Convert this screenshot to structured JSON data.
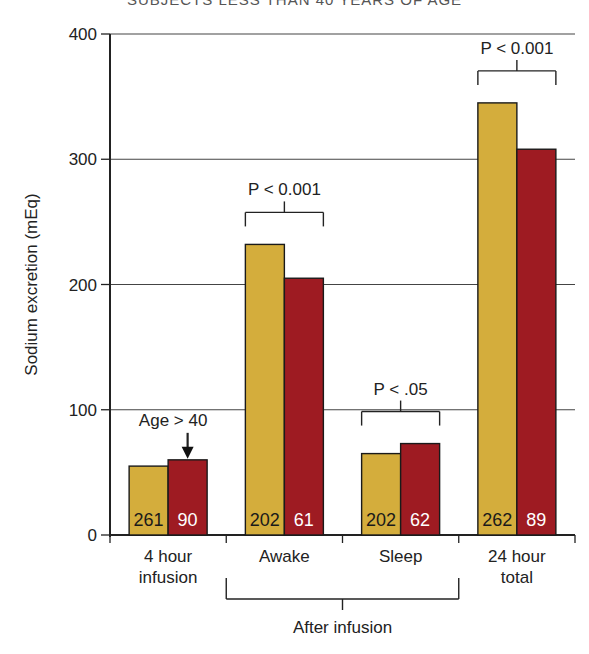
{
  "chart_data": {
    "type": "bar",
    "title": "SUBJECTS LESS THAN 40 YEARS OF AGE",
    "xlabel": "",
    "ylabel": "Sodium excretion (mEq)",
    "ylim": [
      0,
      400
    ],
    "yticks": [
      0,
      100,
      200,
      300,
      400
    ],
    "grid": true,
    "categories": [
      "4 hour\ninfusion",
      "Awake",
      "Sleep",
      "24 hour\ntotal"
    ],
    "category_lines": [
      [
        "4 hour",
        "infusion"
      ],
      [
        "Awake"
      ],
      [
        "Sleep"
      ],
      [
        "24 hour",
        "total"
      ]
    ],
    "series": [
      {
        "name": "Age < 40",
        "color": "#d4ad3c",
        "values": [
          55,
          232,
          65,
          345
        ],
        "n": [
          "261",
          "202",
          "202",
          "262"
        ],
        "label_color": "#1a1a1a"
      },
      {
        "name": "Age > 40",
        "color": "#9e1b22",
        "values": [
          60,
          205,
          73,
          308
        ],
        "n": [
          "90",
          "61",
          "62",
          "89"
        ],
        "label_color": "#ffffff"
      }
    ],
    "annotations": [
      {
        "type": "arrow",
        "text": "Age > 40",
        "category": 0
      },
      {
        "type": "bracket",
        "text": "P < 0.001",
        "category": 1
      },
      {
        "type": "bracket",
        "text": "P < .05",
        "category": 2
      },
      {
        "type": "bracket",
        "text": "P < 0.001",
        "category": 3
      }
    ],
    "group_bracket": {
      "text": "After infusion",
      "from": 1,
      "to": 2
    }
  }
}
